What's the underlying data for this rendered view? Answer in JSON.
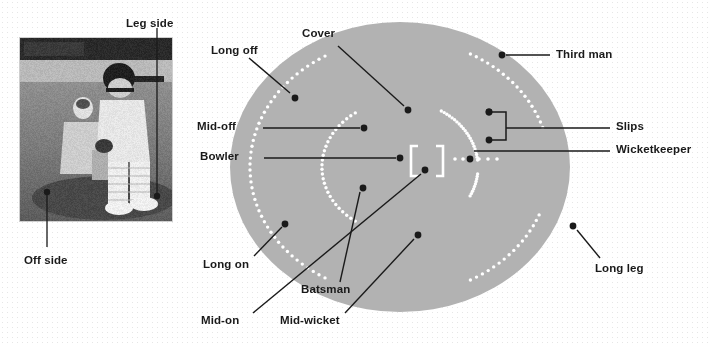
{
  "figure": {
    "background_color": "#ffffff",
    "dot_pattern_color": "#e6e6e6",
    "field_color": "#b2b2b2",
    "line_color": "#1a1a1a",
    "marker_color": "#1a1a1a",
    "pitch_color": "#ffffff",
    "fielder_dot_color": "#ffffff"
  },
  "photo": {
    "caption_leg_side": "Leg side",
    "caption_off_side": "Off side",
    "description": "Black and white photograph of a batsman and wicketkeeper at the crease"
  },
  "labels": {
    "leg_side": "Leg side",
    "off_side": "Off side",
    "long_off": "Long off",
    "cover": "Cover",
    "third_man": "Third man",
    "mid_off": "Mid-off",
    "slips": "Slips",
    "bowler": "Bowler",
    "wicketkeeper": "Wicketkeeper",
    "long_on": "Long on",
    "batsman": "Batsman",
    "mid_on": "Mid-on",
    "mid_wicket": "Mid-wicket",
    "long_leg": "Long leg"
  },
  "positions": [
    {
      "name": "Long off",
      "marker": [
        295,
        98
      ],
      "label_at": [
        211,
        51
      ],
      "leader": [
        [
          290,
          93
        ],
        [
          249,
          58
        ]
      ]
    },
    {
      "name": "Cover",
      "marker": [
        408,
        110
      ],
      "label_at": [
        302,
        33
      ],
      "leader": [
        [
          404,
          106
        ],
        [
          338,
          46
        ]
      ]
    },
    {
      "name": "Third man",
      "marker": [
        502,
        55
      ],
      "label_at": [
        556,
        50
      ],
      "leader": [
        [
          506,
          55
        ],
        [
          550,
          55
        ]
      ]
    },
    {
      "name": "Mid-off",
      "marker": [
        364,
        128
      ],
      "label_at": [
        197,
        123
      ],
      "leader": [
        [
          360,
          128
        ],
        [
          263,
          128
        ]
      ]
    },
    {
      "name": "Slips",
      "marker": [
        489,
        112
      ],
      "label_at": [
        616,
        123
      ],
      "leader": [
        [
          506,
          128
        ],
        [
          610,
          128
        ]
      ]
    },
    {
      "name": "Bowler",
      "marker": [
        400,
        158
      ],
      "label_at": [
        200,
        153
      ],
      "leader": [
        [
          396,
          158
        ],
        [
          264,
          158
        ]
      ]
    },
    {
      "name": "Wicketkeeper",
      "marker": [
        470,
        159
      ],
      "label_at": [
        616,
        146
      ],
      "leader": [
        [
          474,
          151
        ],
        [
          610,
          151
        ]
      ]
    },
    {
      "name": "Long on",
      "marker": [
        285,
        224
      ],
      "label_at": [
        203,
        263
      ],
      "leader": [
        [
          282,
          227
        ],
        [
          254,
          256
        ]
      ]
    },
    {
      "name": "Batsman",
      "marker": [
        363,
        188
      ],
      "label_at": [
        301,
        288
      ],
      "leader": [
        [
          360,
          192
        ],
        [
          340,
          282
        ]
      ]
    },
    {
      "name": "Mid-on",
      "marker": [
        425,
        170
      ],
      "label_at": [
        201,
        320
      ],
      "leader": [
        [
          421,
          174
        ],
        [
          253,
          313
        ]
      ]
    },
    {
      "name": "Mid-wicket",
      "marker": [
        418,
        235
      ],
      "label_at": [
        280,
        320
      ],
      "leader": [
        [
          414,
          239
        ],
        [
          345,
          313
        ]
      ]
    },
    {
      "name": "Long leg",
      "marker": [
        573,
        226
      ],
      "label_at": [
        595,
        268
      ],
      "leader": [
        [
          577,
          230
        ],
        [
          600,
          258
        ]
      ]
    }
  ],
  "slip_bracket": {
    "dots": [
      [
        489,
        112
      ],
      [
        489,
        140
      ]
    ],
    "stem_x": 506
  },
  "field": {
    "oval_center": [
      400,
      167
    ],
    "oval_rx": 170,
    "oval_ry": 145,
    "inner_ring": "dotted 30-yard circle",
    "boundary_ring": "dotted boundary markers"
  },
  "pitch": {
    "left_bracket_x": 411,
    "right_bracket_x": 443,
    "top_y": 146,
    "bottom_y": 176
  }
}
